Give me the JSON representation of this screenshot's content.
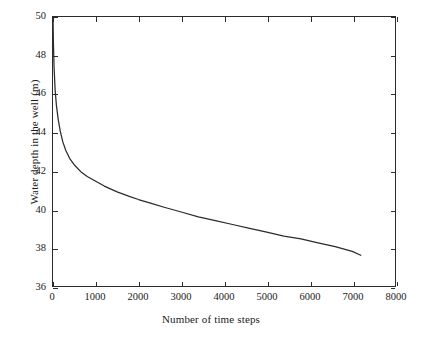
{
  "chart_data": {
    "type": "line",
    "title": "",
    "xlabel": "Number of time steps",
    "ylabel": "Water depth in the well (m)",
    "xlim": [
      0,
      8000
    ],
    "ylim": [
      36,
      50
    ],
    "xticks": [
      0,
      1000,
      2000,
      3000,
      4000,
      5000,
      6000,
      7000,
      8000
    ],
    "yticks": [
      36,
      38,
      40,
      42,
      44,
      46,
      48,
      50
    ],
    "xtick_labels": [
      "0",
      "1000",
      "2000",
      "3000",
      "4000",
      "5000",
      "6000",
      "7000",
      "8000"
    ],
    "ytick_labels": [
      "36",
      "38",
      "40",
      "42",
      "44",
      "46",
      "48",
      "50"
    ],
    "grid": false,
    "legend": null,
    "series": [
      {
        "name": "Water depth in the well",
        "color": "#2b2b2b",
        "x": [
          0,
          10,
          25,
          50,
          80,
          120,
          170,
          230,
          300,
          400,
          500,
          650,
          800,
          1000,
          1200,
          1500,
          1800,
          2000,
          2300,
          2600,
          3000,
          3400,
          3800,
          4200,
          4600,
          5000,
          5400,
          5800,
          6200,
          6600,
          7000,
          7200
        ],
        "y": [
          50.0,
          48.6,
          47.4,
          46.2,
          45.4,
          44.7,
          44.05,
          43.5,
          43.05,
          42.6,
          42.3,
          41.95,
          41.7,
          41.45,
          41.2,
          40.9,
          40.65,
          40.5,
          40.3,
          40.1,
          39.85,
          39.6,
          39.4,
          39.2,
          39.0,
          38.8,
          38.6,
          38.45,
          38.25,
          38.05,
          37.8,
          37.6
        ]
      }
    ]
  },
  "axes": {
    "y_labels": [
      "50",
      "48",
      "46",
      "44",
      "42",
      "40",
      "38",
      "36"
    ],
    "x_labels": [
      "0",
      "1000",
      "2000",
      "3000",
      "4000",
      "5000",
      "6000",
      "7000",
      "8000"
    ],
    "x_title": "Number of time steps",
    "y_title": "Water depth in the well (m)"
  }
}
